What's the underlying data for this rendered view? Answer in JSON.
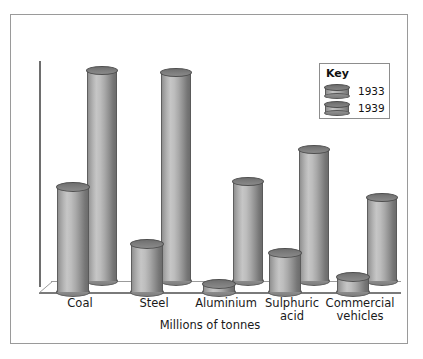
{
  "frame": {
    "border_color": "#9a9a9a",
    "background": "#ffffff"
  },
  "chart_data": {
    "type": "bar",
    "title": "",
    "subtitle": "",
    "xlabel": "Millions of tonnes",
    "ylabel": "",
    "categories": [
      "Coal",
      "Steel",
      "Aluminium",
      "Sulphuric\nacid",
      "Commercial\nvehicles"
    ],
    "category_lines": [
      [
        "Coal"
      ],
      [
        "Steel"
      ],
      [
        "Aluminium"
      ],
      [
        "Sulphuric",
        "acid"
      ],
      [
        "Commercial",
        "vehicles"
      ]
    ],
    "series": [
      {
        "name": "1933",
        "values": [
          48,
          22,
          3,
          18,
          7
        ]
      },
      {
        "name": "1939",
        "values": [
          96,
          95,
          45,
          60,
          38
        ]
      }
    ],
    "ylim": [
      0,
      100
    ],
    "grid": false,
    "axis_ticks": false,
    "legend_position": "top-right",
    "legend_title": "Key",
    "style": "3d-cylinder",
    "bar_color": "#a8a8a8",
    "bar_edge_color": "#5f5f5f",
    "axis_color": "#6e6e6e"
  },
  "legend": {
    "title": "Key",
    "entries": [
      {
        "label": "1933",
        "swatch": "cylinder-swatch-1933"
      },
      {
        "label": "1939",
        "swatch": "cylinder-swatch-1939"
      }
    ]
  },
  "caption": {
    "text": "Millions of tonnes"
  }
}
